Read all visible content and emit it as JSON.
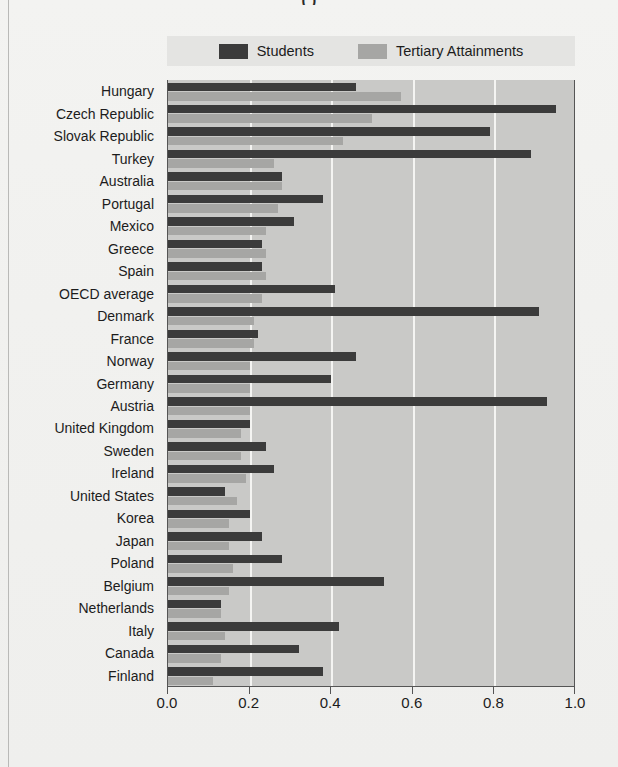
{
  "figure": {
    "caption_visible_fragment": "( )"
  },
  "legend": {
    "position": "top",
    "entries": [
      {
        "label": "Students",
        "color": "#3b3b3b",
        "swatch_name": "students-swatch"
      },
      {
        "label": "Tertiary Attainments",
        "color": "#a6a6a4",
        "swatch_name": "tertiary-swatch"
      }
    ]
  },
  "colors": {
    "plot_background": "#c9c9c7",
    "gridline": "#f4f4f2",
    "students_bar": "#3b3b3b",
    "tertiary_bar": "#a6a6a4",
    "axis_line": "#555555",
    "page_background": "#f2f2f0",
    "legend_background": "#e4e4e2",
    "text": "#1c1c1c"
  },
  "chart_data": {
    "type": "bar",
    "orientation": "horizontal",
    "title": "",
    "xlabel": "",
    "ylabel": "",
    "xlim": [
      0.0,
      1.0
    ],
    "xticks": [
      "0.0",
      "0.2",
      "0.4",
      "0.6",
      "0.8",
      "1.0"
    ],
    "xtick_values": [
      0.0,
      0.2,
      0.4,
      0.6,
      0.8,
      1.0
    ],
    "grid": true,
    "grid_axis": "x",
    "legend_position": "top",
    "categories": [
      "Hungary",
      "Czech Republic",
      "Slovak Republic",
      "Turkey",
      "Australia",
      "Portugal",
      "Mexico",
      "Greece",
      "Spain",
      "OECD average",
      "Denmark",
      "France",
      "Norway",
      "Germany",
      "Austria",
      "United Kingdom",
      "Sweden",
      "Ireland",
      "United States",
      "Korea",
      "Japan",
      "Poland",
      "Belgium",
      "Netherlands",
      "Italy",
      "Canada",
      "Finland"
    ],
    "series": [
      {
        "name": "Students",
        "color": "#3b3b3b",
        "values": [
          0.46,
          0.95,
          0.79,
          0.89,
          0.28,
          0.38,
          0.31,
          0.23,
          0.23,
          0.41,
          0.91,
          0.22,
          0.46,
          0.4,
          0.93,
          0.2,
          0.24,
          0.26,
          0.14,
          0.2,
          0.23,
          0.28,
          0.53,
          0.13,
          0.42,
          0.32,
          0.38
        ]
      },
      {
        "name": "Tertiary Attainments",
        "color": "#a6a6a4",
        "values": [
          0.57,
          0.5,
          0.43,
          0.26,
          0.28,
          0.27,
          0.24,
          0.24,
          0.24,
          0.23,
          0.21,
          0.21,
          0.2,
          0.2,
          0.2,
          0.18,
          0.18,
          0.19,
          0.17,
          0.15,
          0.15,
          0.16,
          0.15,
          0.13,
          0.14,
          0.13,
          0.11
        ]
      }
    ]
  }
}
